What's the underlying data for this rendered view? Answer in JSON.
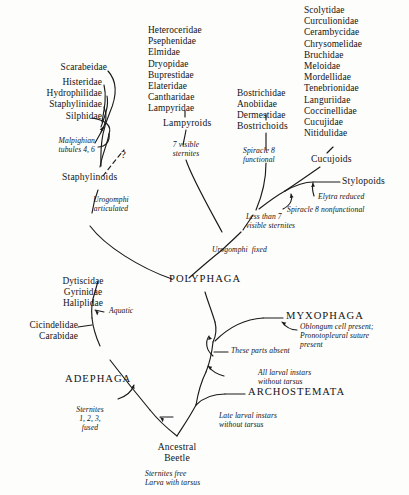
{
  "diagram": {
    "type": "cladogram",
    "background_color": "#fdfdfc",
    "line_color": "#1a1a1a"
  },
  "groups": {
    "staphylinoid_families": "Scarabeidae",
    "staphylinoid_families_2": "Histeridae\nHydrophilidae\nStaphylinidae\nSilphidae",
    "lampyroid_families": "Heteroceridae\nPsephenidae\nElmidae\nDryopidae\nBuprestidae\nElateridae\nCantharidae\nLampyridae",
    "bostrichoid_families": "Bostrichidae\nAnobiidae\nDermestidae",
    "cucujoid_families": "Scolytidae\nCurculionidae\nCerambycidae\nChrysomelidae\nBruchidae\nMeloidae\nMordellidae\nTenebrionidae\nLanguriidae\nCoccinellidae\nCucujidae\nNitidulidae",
    "adephaga_aquatic_families": "Dytiscidae\nGyrinidae\nHaliplidae",
    "adephaga_terrestrial_families": "Cicindelidae\nCarabidae"
  },
  "clades": {
    "staphylinoids": "Staphylinoids",
    "lampyroids": "Lampyroids",
    "bostrichoids": "Bostrichoids",
    "cucujoids": "Cucujoids",
    "stylopoids": "Stylopoids",
    "polyphaga": "POLYPHAGA",
    "adephaga": "ADEPHAGA",
    "myxophaga": "MYXOPHAGA",
    "archostemata": "ARCHOSTEMATA",
    "ancestral_beetle": "Ancestral\nBeetle"
  },
  "characters": {
    "malpighian": "Malpighian\ntubules 4, 6",
    "uncertain_marker": "?",
    "seven_sternites": "7 visible\nsternites",
    "spiracle8_functional": "Spiracle 8\nfunctional",
    "urogomphi_articulated": "Urogomphi\narticulated",
    "less_than_7": "Less than 7\nvisible sternites",
    "elytra_reduced": "Elytra reduced",
    "spiracle8_nonfunctional": "Spiracle 8 nonfunctional",
    "urogomphi_fixed": "Urogomphi  fixed",
    "aquatic": "Aquatic",
    "oblongum": "Oblongum cell present;\nPronotopleural suture\npresent",
    "parts_absent": "These parts absent",
    "all_larval_instars": "All larval instars\nwithout tarsus",
    "late_larval_instars": "Late larval instars\nwithout tarsus",
    "sternites_fused": "Sternites\n1, 2, 3,\nfused",
    "ancestral_state": "Sternites free\nLarva with tarsus"
  }
}
